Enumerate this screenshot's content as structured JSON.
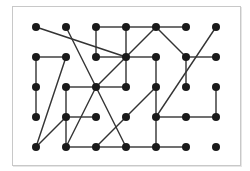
{
  "diagram": {
    "type": "graph",
    "colors": {
      "node": "#1a1a1a",
      "edge": "#333333",
      "frame": "#c8c8c8"
    },
    "grid": {
      "cols_x": [
        36,
        66,
        96,
        126,
        156,
        186,
        216
      ],
      "rows_y": [
        27,
        57,
        87,
        117,
        147
      ]
    },
    "nodes": [
      [
        0,
        0
      ],
      [
        1,
        0
      ],
      [
        2,
        0
      ],
      [
        3,
        0
      ],
      [
        4,
        0
      ],
      [
        5,
        0
      ],
      [
        6,
        0
      ],
      [
        0,
        1
      ],
      [
        1,
        1
      ],
      [
        2,
        1
      ],
      [
        3,
        1
      ],
      [
        4,
        1
      ],
      [
        5,
        1
      ],
      [
        6,
        1
      ],
      [
        0,
        2
      ],
      [
        1,
        2
      ],
      [
        2,
        2
      ],
      [
        3,
        2
      ],
      [
        4,
        2
      ],
      [
        5,
        2
      ],
      [
        6,
        2
      ],
      [
        0,
        3
      ],
      [
        1,
        3
      ],
      [
        2,
        3
      ],
      [
        3,
        3
      ],
      [
        4,
        3
      ],
      [
        5,
        3
      ],
      [
        6,
        3
      ],
      [
        0,
        4
      ],
      [
        1,
        4
      ],
      [
        2,
        4
      ],
      [
        3,
        4
      ],
      [
        4,
        4
      ],
      [
        5,
        4
      ],
      [
        6,
        4
      ]
    ],
    "edges": [
      [
        [
          0,
          0
        ],
        [
          3,
          1
        ]
      ],
      [
        [
          1,
          0
        ],
        [
          2,
          2
        ]
      ],
      [
        [
          2,
          0
        ],
        [
          3,
          0
        ]
      ],
      [
        [
          3,
          0
        ],
        [
          4,
          0
        ]
      ],
      [
        [
          4,
          0
        ],
        [
          5,
          0
        ]
      ],
      [
        [
          2,
          0
        ],
        [
          2,
          1
        ]
      ],
      [
        [
          3,
          0
        ],
        [
          3,
          1
        ]
      ],
      [
        [
          2,
          1
        ],
        [
          3,
          1
        ]
      ],
      [
        [
          3,
          1
        ],
        [
          4,
          0
        ]
      ],
      [
        [
          3,
          1
        ],
        [
          4,
          1
        ]
      ],
      [
        [
          3,
          1
        ],
        [
          2,
          2
        ]
      ],
      [
        [
          3,
          1
        ],
        [
          3,
          2
        ]
      ],
      [
        [
          4,
          0
        ],
        [
          5,
          1
        ]
      ],
      [
        [
          5,
          1
        ],
        [
          6,
          1
        ]
      ],
      [
        [
          5,
          1
        ],
        [
          5,
          2
        ]
      ],
      [
        [
          6,
          0
        ],
        [
          4,
          3
        ]
      ],
      [
        [
          4,
          1
        ],
        [
          4,
          2
        ]
      ],
      [
        [
          4,
          2
        ],
        [
          4,
          3
        ]
      ],
      [
        [
          4,
          3
        ],
        [
          4,
          4
        ]
      ],
      [
        [
          0,
          1
        ],
        [
          1,
          1
        ]
      ],
      [
        [
          0,
          1
        ],
        [
          0,
          2
        ]
      ],
      [
        [
          0,
          2
        ],
        [
          0,
          3
        ]
      ],
      [
        [
          1,
          1
        ],
        [
          0,
          4
        ]
      ],
      [
        [
          1,
          2
        ],
        [
          2,
          2
        ]
      ],
      [
        [
          2,
          2
        ],
        [
          3,
          2
        ]
      ],
      [
        [
          1,
          2
        ],
        [
          1,
          3
        ]
      ],
      [
        [
          1,
          3
        ],
        [
          1,
          4
        ]
      ],
      [
        [
          1,
          3
        ],
        [
          2,
          3
        ]
      ],
      [
        [
          1,
          3
        ],
        [
          0,
          4
        ]
      ],
      [
        [
          2,
          2
        ],
        [
          1,
          4
        ]
      ],
      [
        [
          2,
          2
        ],
        [
          3,
          4
        ]
      ],
      [
        [
          4,
          2
        ],
        [
          3,
          3
        ]
      ],
      [
        [
          3,
          3
        ],
        [
          2,
          4
        ]
      ],
      [
        [
          1,
          4
        ],
        [
          2,
          4
        ]
      ],
      [
        [
          2,
          4
        ],
        [
          3,
          4
        ]
      ],
      [
        [
          3,
          4
        ],
        [
          4,
          4
        ]
      ],
      [
        [
          4,
          3
        ],
        [
          5,
          3
        ]
      ],
      [
        [
          5,
          3
        ],
        [
          6,
          3
        ]
      ],
      [
        [
          6,
          2
        ],
        [
          6,
          3
        ]
      ],
      [
        [
          4,
          4
        ],
        [
          5,
          4
        ]
      ]
    ]
  }
}
